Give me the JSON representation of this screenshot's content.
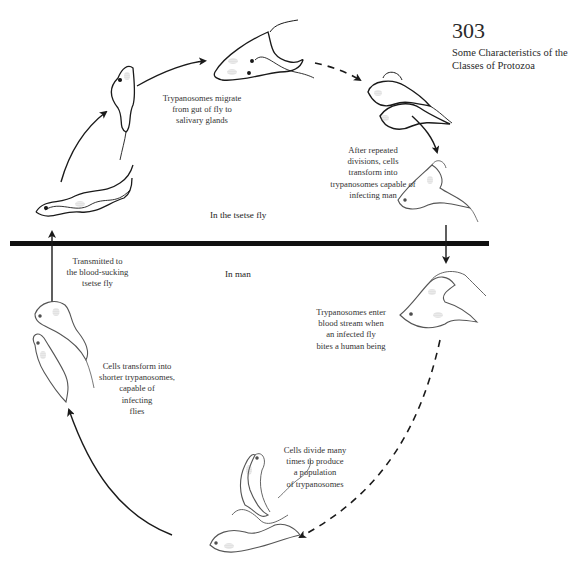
{
  "page": {
    "number": "303",
    "running_head": "Some Characteristics of the Classes of Protozoa"
  },
  "regions": {
    "fly": "In the tsetse fly",
    "man": "In man"
  },
  "captions": {
    "migrate": [
      "Trypanosomes migrate",
      "from gut of fly to",
      "salivary glands"
    ],
    "transform_man": [
      "After repeated",
      "divisions, cells",
      "transform into",
      "trypanosomes capable of",
      "infecting man"
    ],
    "transmitted": [
      "Transmitted to",
      "the blood-sucking",
      "tsetse fly"
    ],
    "enter_blood": [
      "Trypanosomes enter",
      "blood stream when",
      "an infected fly",
      "bites a human being"
    ],
    "transform_flies": [
      "Cells transform into",
      "shorter trypanosomes,",
      "capable of",
      "infecting",
      "flies"
    ],
    "divide": [
      "Cells divide many",
      "times to produce",
      "a population",
      "of trypanosomes"
    ]
  },
  "colors": {
    "ink": "#1a1a1a",
    "divider": "#111111",
    "nucleus": "#9a9a9a",
    "cell_light": "#555555"
  }
}
